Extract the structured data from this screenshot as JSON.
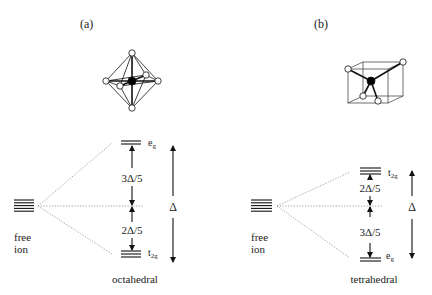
{
  "panels": [
    {
      "id": "a",
      "label": "(a)",
      "structure": "octahedron",
      "free_ion": {
        "line1": "free",
        "line2": "ion",
        "degenerate_levels": 5
      },
      "upper_level": {
        "name": "e",
        "sub": "g",
        "lines": 2
      },
      "lower_level": {
        "name": "t",
        "sub": "2g",
        "lines": 3
      },
      "upper_gap": "3Δ/5",
      "lower_gap": "2Δ/5",
      "splitting": "Δ",
      "caption": "octahedral"
    },
    {
      "id": "b",
      "label": "(b)",
      "structure": "cube-tetrahedron",
      "free_ion": {
        "line1": "free",
        "line2": "ion",
        "degenerate_levels": 5
      },
      "upper_level": {
        "name": "t",
        "sub": "2g",
        "lines": 3
      },
      "lower_level": {
        "name": "e",
        "sub": "g",
        "lines": 2
      },
      "upper_gap": "2Δ/5",
      "lower_gap": "3Δ/5",
      "splitting": "Δ",
      "caption": "tetrahedral"
    }
  ],
  "colors": {
    "line": "#111111",
    "dotted": "#888888",
    "ligand_fill": "#ffffff",
    "center_fill": "#000000"
  }
}
